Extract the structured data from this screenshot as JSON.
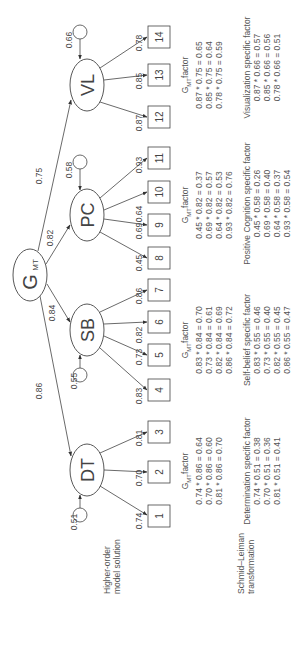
{
  "figure": {
    "side_labels": {
      "higher_order": [
        "Higher-order",
        "model solution"
      ],
      "schmid_leiman": [
        "Schmid–Leiman",
        "transformation"
      ]
    },
    "general_factor": {
      "label": "G",
      "subscript": "MT"
    },
    "first_order_factors": [
      {
        "id": "DT",
        "label": "DT",
        "loading_from_g": "0.86",
        "residual": "0.51",
        "indicators": [
          "1",
          "2",
          "3"
        ],
        "indicator_loadings": [
          "0.74",
          "0.70",
          "0.81"
        ]
      },
      {
        "id": "SB",
        "label": "SB",
        "loading_from_g": "0.84",
        "residual": "0.55",
        "indicators": [
          "4",
          "5",
          "6",
          "7"
        ],
        "indicator_loadings": [
          "0.83",
          "0.73",
          "0.82",
          "0.86"
        ]
      },
      {
        "id": "PC",
        "label": "PC",
        "loading_from_g": "0.82",
        "residual": "0.58",
        "indicators": [
          "8",
          "9",
          "10",
          "11"
        ],
        "indicator_loadings": [
          "0.45",
          "0.69",
          "0.64",
          "0.93"
        ]
      },
      {
        "id": "VL",
        "label": "VL",
        "loading_from_g": "0.75",
        "residual": "0.66",
        "indicators": [
          "12",
          "13",
          "14"
        ],
        "indicator_loadings": [
          "0.87",
          "0.85",
          "0.78"
        ]
      }
    ],
    "gmt_factor_blocks": [
      {
        "title_prefix": "G",
        "title_sub": "MT",
        "title_suffix": "factor",
        "lines": [
          "0.74 * 0.86 = 0.64",
          "0.70 * 0.86 = 0.60",
          "0.81 * 0.86 = 0.70"
        ]
      },
      {
        "title_prefix": "G",
        "title_sub": "MT",
        "title_suffix": "factor",
        "lines": [
          "0.83 * 0.84 = 0.70",
          "0.73 * 0.84 = 0.61",
          "0.82 * 0.84 = 0.69",
          "0.86 * 0.84 = 0.72"
        ]
      },
      {
        "title_prefix": "G",
        "title_sub": "MT",
        "title_suffix": "factor",
        "lines": [
          "0.45 * 0.82 = 0.37",
          "0.69 * 0.82 = 0.57",
          "0.64 * 0.82 = 0.53",
          "0.93 * 0.82 = 0.76"
        ]
      },
      {
        "title_prefix": "G",
        "title_sub": "MT",
        "title_suffix": "factor",
        "lines": [
          "0.87 * 0.75 = 0.65",
          "0.85 * 0.75 = 0.64",
          "0.78 * 0.75 = 0.59"
        ]
      }
    ],
    "specific_factor_blocks": [
      {
        "title": "Determination specific factor",
        "lines": [
          "0.74 * 0.51 = 0.38",
          "0.70 * 0.51 = 0.36",
          "0.81 * 0.51 = 0.41"
        ]
      },
      {
        "title": "Self-belief specific factor",
        "lines": [
          "0.83 * 0.55 = 0.46",
          "0.73 * 0.55 = 0.40",
          "0.82 * 0.55 = 0.45",
          "0.86 * 0.55 = 0.47"
        ]
      },
      {
        "title": "Positive Cognition specific factor",
        "lines": [
          "0.45 * 0.58 = 0.26",
          "0.69 * 0.58 = 0.40",
          "0.64 * 0.58 = 0.37",
          "0.93 * 0.58 = 0.54"
        ]
      },
      {
        "title": "Visualization specific factor",
        "lines": [
          "0.87 * 0.66 = 0.57",
          "0.85 * 0.66 = 0.56",
          "0.78 * 0.66 = 0.51"
        ]
      }
    ],
    "colors": {
      "stroke": "#444444",
      "text": "#555555",
      "background": "#ffffff"
    }
  }
}
